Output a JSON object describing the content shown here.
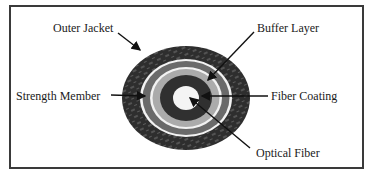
{
  "diagram": {
    "type": "fiber-optic-cable-cross-section",
    "labels": {
      "outer_jacket": "Outer Jacket",
      "buffer_layer": "Buffer Layer",
      "strength_member": "Strength Member",
      "fiber_coating": "Fiber Coating",
      "optical_fiber": "Optical Fiber"
    },
    "layers": [
      {
        "name": "Outer Jacket",
        "color": "#2e2e2e",
        "texture": "hatched"
      },
      {
        "name": "Strength Member",
        "color": "#6a6a6a"
      },
      {
        "name": "Buffer Layer",
        "color": "#ababab"
      },
      {
        "name": "Fiber Coating",
        "color": "#303030"
      },
      {
        "name": "Optical Fiber",
        "color": "#f4f4f4"
      }
    ],
    "colors": {
      "frame": "#3a3a3a",
      "separator": "#f2f2f2",
      "arrow": "#111111"
    }
  }
}
